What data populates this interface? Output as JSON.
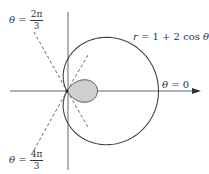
{
  "figure": {
    "curve_label": "r = 1 + 2 cos θ",
    "curve_label_parts": {
      "lhs": "r",
      "eq": " = 1 + 2 cos ",
      "theta": "θ"
    },
    "ray_labels": [
      {
        "theta": "θ",
        "eq": " = ",
        "num": "2π",
        "den": "3"
      },
      {
        "theta": "θ",
        "eq": " = ",
        "num": "4π",
        "den": "3"
      },
      {
        "theta": "θ",
        "eq": " = 0",
        "num": "",
        "den": ""
      }
    ],
    "colors": {
      "curve": "#444444",
      "axis": "#555555",
      "inner_loop_fill": "#cccccc",
      "dashed": "#555555"
    }
  }
}
